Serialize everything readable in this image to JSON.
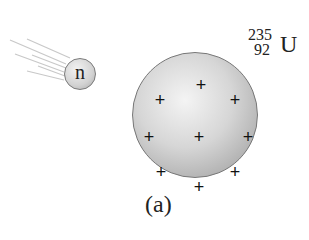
{
  "diagram": {
    "neutron": {
      "label": "n",
      "icon": "neutron-particle"
    },
    "nucleus": {
      "isotope_mass_number": "235",
      "isotope_atomic_number": "92",
      "isotope_symbol": "U",
      "charges": [
        "+",
        "+",
        "+",
        "+",
        "+",
        "+",
        "+",
        "+",
        "+"
      ]
    },
    "caption": "(a)"
  }
}
